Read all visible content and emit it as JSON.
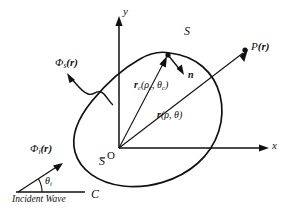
{
  "figure": {
    "background": "#ffffff",
    "ink": "#111111",
    "width": 288,
    "height": 209
  },
  "axes": {
    "y_label": "y",
    "x_label": "x",
    "origin_label": "O"
  },
  "regions": {
    "exterior_label": "S",
    "interior_label": "S",
    "interior_accent": "~",
    "contour_label": "C"
  },
  "fields": {
    "scattered_symbol": "Φ",
    "scattered_subscript": "s",
    "scattered_arg": "(r)",
    "incident_symbol": "Φ",
    "incident_subscript": "i",
    "incident_arg": "(r)",
    "incident_angle": "θ",
    "incident_angle_subscript": "i",
    "incident_caption": "Incident Wave"
  },
  "vectors": {
    "normal_label": "n",
    "surface_vector_symbol": "r",
    "surface_vector_subscript": "c",
    "surface_vector_args": "(ρ",
    "surface_vector_args_sub1": "c",
    "surface_vector_args_mid": ", θ",
    "surface_vector_args_sub2": "c",
    "surface_vector_args_end": ")",
    "field_vector_symbol": "r",
    "field_vector_args": "(ρ, θ)"
  },
  "observation": {
    "point_symbol": "P",
    "point_arg": "(r)"
  }
}
